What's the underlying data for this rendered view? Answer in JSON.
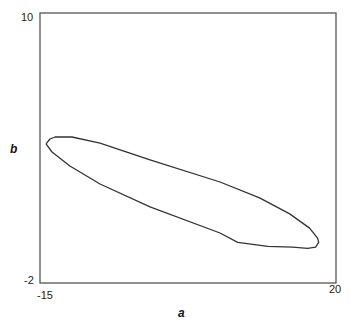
{
  "chart_data": {
    "type": "line",
    "title": "",
    "xlabel": "a",
    "ylabel": "b",
    "xlim": [
      -15,
      20
    ],
    "ylim": [
      -2,
      10
    ],
    "x_tick_labels": [
      "-15",
      "20"
    ],
    "y_tick_labels": [
      "10",
      "-2"
    ],
    "grid": false,
    "legend": null,
    "series": [
      {
        "name": "confidence ellipse",
        "closed": true,
        "points": [
          [
            -14.29,
            4.18
          ],
          [
            -13.82,
            4.4
          ],
          [
            -13.23,
            4.49
          ],
          [
            -11.22,
            4.49
          ],
          [
            -7.91,
            4.22
          ],
          [
            -1.99,
            3.47
          ],
          [
            6.28,
            2.49
          ],
          [
            10.97,
            1.78
          ],
          [
            14.52,
            1.07
          ],
          [
            16.88,
            0.44
          ],
          [
            17.83,
            -0.01
          ],
          [
            17.95,
            -0.19
          ],
          [
            17.59,
            -0.41
          ],
          [
            16.65,
            -0.46
          ],
          [
            14.88,
            -0.41
          ],
          [
            11.93,
            -0.37
          ],
          [
            8.38,
            -0.19
          ],
          [
            6.28,
            0.22
          ],
          [
            -1.99,
            1.38
          ],
          [
            -7.91,
            2.4
          ],
          [
            -11.46,
            3.2
          ],
          [
            -13.58,
            3.82
          ],
          [
            -14.29,
            4.18
          ]
        ]
      }
    ]
  }
}
